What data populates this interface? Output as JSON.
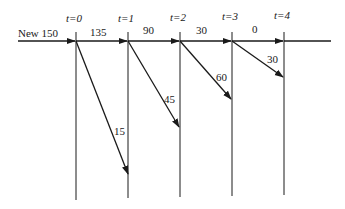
{
  "diagram": {
    "type": "flow-timeline",
    "input_label": "New 150",
    "time_labels": [
      "t=0",
      "t=1",
      "t=2",
      "t=3",
      "t=4"
    ],
    "flow_labels": [
      "135",
      "90",
      "30",
      "0"
    ],
    "exit_labels": [
      "15",
      "45",
      "60",
      "30"
    ],
    "colors": {
      "line": "#1a1a1a",
      "background": "#ffffff"
    }
  }
}
